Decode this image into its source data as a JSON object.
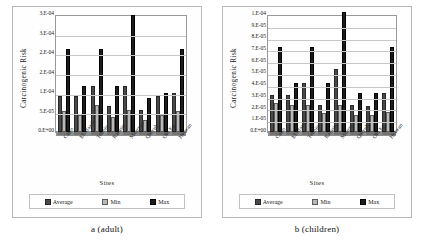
{
  "figure": {
    "panels": [
      {
        "caption": "a (adult)",
        "chart_data": {
          "type": "bar",
          "title": "",
          "xlabel": "Sites",
          "ylabel": "Carcinogenic Risk",
          "categories": [
            "Cairo",
            "El Maadi",
            "Tebbin",
            "Ramsis",
            "Maarrya",
            "Qalyub",
            "Old Eg",
            "Helwan"
          ],
          "ylim": [
            0,
            0.00035
          ],
          "ytick_labels": [
            "3.E-04",
            "3.E-04",
            "2.E-04",
            "2.E-04",
            "1.E-04",
            "5.E-05",
            "0.E+00"
          ],
          "ytick_values": [
            0.00035,
            0.0003,
            0.00025,
            0.0002,
            0.00015,
            0.0001,
            5e-05,
            0
          ],
          "grid": true,
          "legend": "bottom",
          "series": [
            {
              "name": "Average",
              "values": [
                0.0001,
                0.0001,
                0.00013,
                7e-05,
                0.00013,
                6e-05,
                0.0001,
                0.00011
              ]
            },
            {
              "name": "Min",
              "values": [
                5.5e-05,
                4.5e-05,
                7.5e-05,
                4e-05,
                6e-05,
                3e-05,
                4.5e-05,
                5.5e-05
              ]
            },
            {
              "name": "Max",
              "values": [
                0.00024,
                0.00013,
                0.00024,
                0.00013,
                0.00034,
                9.5e-05,
                0.00011,
                0.00024
              ]
            }
          ]
        }
      },
      {
        "caption": "b (children)",
        "chart_data": {
          "type": "bar",
          "title": "",
          "xlabel": "Sites",
          "ylabel": "Carcinogenic Risk",
          "categories": [
            "Cairo",
            "El Maadi",
            "Tebbin",
            "Ramsis",
            "Maarrya",
            "Qalyub",
            "Old Eg",
            "Helwan"
          ],
          "ylim": [
            0,
            0.0001
          ],
          "ytick_labels": [
            "1.E-04",
            "9.E-05",
            "8.E-05",
            "7.E-05",
            "6.E-05",
            "5.E-05",
            "4.E-05",
            "3.E-05",
            "2.E-05",
            "1.E-05",
            "0.E+00"
          ],
          "ytick_values": [
            0.0001,
            9e-05,
            8e-05,
            7e-05,
            6e-05,
            5e-05,
            4e-05,
            3e-05,
            2e-05,
            1e-05,
            0
          ],
          "grid": true,
          "legend": "bottom",
          "series": [
            {
              "name": "Average",
              "values": [
                3e-05,
                3e-05,
                4e-05,
                2.1e-05,
                5.2e-05,
                2.1e-05,
                2e-05,
                3.1e-05
              ]
            },
            {
              "name": "Min",
              "values": [
                2.3e-05,
                2.1e-05,
                2.1e-05,
                1.4e-05,
                2.1e-05,
                1.3e-05,
                1.3e-05,
                1.5e-05
              ]
            },
            {
              "name": "Max",
              "values": [
                7e-05,
                4e-05,
                7e-05,
                4e-05,
                0.0001,
                3.1e-05,
                3.1e-05,
                7e-05
              ]
            }
          ]
        }
      }
    ],
    "legend_labels": [
      "Average",
      "Min",
      "Max"
    ],
    "colors": {
      "average": "#4a4a4a",
      "min": "#b9b9b9",
      "max": "#1c1c1c",
      "grid": "#c9c9c9",
      "frame": "#9a9a9a"
    }
  }
}
